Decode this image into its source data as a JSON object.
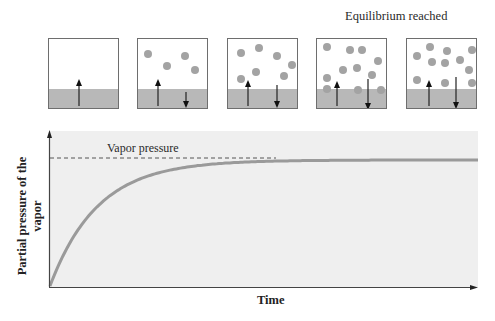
{
  "figure": {
    "equilibrium_label": "Equilibrium reached",
    "boxes": [
      {
        "name": "box-1",
        "left": 48,
        "molecules": [],
        "up_arrow": {
          "x": 30,
          "top": 40
        },
        "down_arrow": null
      },
      {
        "name": "box-2",
        "left": 137,
        "molecules": [
          [
            6,
            11
          ],
          [
            43,
            13
          ],
          [
            25,
            23
          ],
          [
            53,
            27
          ]
        ],
        "up_arrow": {
          "x": 20,
          "top": 40
        },
        "down_arrow": {
          "x": 48,
          "top": 53,
          "len": 15
        }
      },
      {
        "name": "box-3",
        "left": 227,
        "molecules": [
          [
            9,
            10
          ],
          [
            27,
            5
          ],
          [
            45,
            13
          ],
          [
            60,
            22
          ],
          [
            24,
            29
          ],
          [
            9,
            36
          ],
          [
            52,
            33
          ]
        ],
        "up_arrow": {
          "x": 20,
          "top": 41
        },
        "down_arrow": {
          "x": 49,
          "top": 46,
          "len": 22
        }
      },
      {
        "name": "box-4",
        "left": 316,
        "molecules": [
          [
            6,
            4
          ],
          [
            29,
            7
          ],
          [
            41,
            7
          ],
          [
            57,
            18
          ],
          [
            22,
            27
          ],
          [
            36,
            25
          ],
          [
            6,
            35
          ],
          [
            51,
            32
          ],
          [
            6,
            46
          ],
          [
            37,
            47
          ],
          [
            60,
            47
          ]
        ],
        "up_arrow": {
          "x": 20,
          "top": 42
        },
        "down_arrow": {
          "x": 51,
          "top": 40,
          "len": 30
        }
      },
      {
        "name": "box-5",
        "left": 406,
        "molecules": [
          [
            19,
            4
          ],
          [
            36,
            8
          ],
          [
            61,
            7
          ],
          [
            6,
            13
          ],
          [
            21,
            19
          ],
          [
            34,
            20
          ],
          [
            49,
            17
          ],
          [
            58,
            27
          ],
          [
            6,
            37
          ],
          [
            34,
            40
          ],
          [
            61,
            40
          ]
        ],
        "up_arrow": {
          "x": 22,
          "top": 41
        },
        "down_arrow": {
          "x": 49,
          "top": 38,
          "len": 31
        }
      }
    ]
  },
  "chart_data": {
    "type": "line",
    "title": "",
    "xlabel": "Time",
    "ylabel": "Partial pressure of the vapor",
    "annotations": [
      {
        "text": "Vapor pressure",
        "type": "dashed-horizontal-line",
        "y": 1.0
      }
    ],
    "x": [
      0,
      0.05,
      0.1,
      0.2,
      0.3,
      0.4,
      0.5,
      0.6,
      0.8,
      1.0
    ],
    "series": [
      {
        "name": "Partial pressure of the vapor",
        "values": [
          0,
          0.44,
          0.63,
          0.82,
          0.92,
          0.97,
          0.99,
          1.0,
          1.0,
          1.0
        ]
      }
    ],
    "xlim": [
      0,
      1
    ],
    "ylim": [
      0,
      1.2
    ],
    "grid": false,
    "colors": {
      "curve": "#9a9a9a",
      "background": "#efefef",
      "axis": "#444444"
    }
  }
}
